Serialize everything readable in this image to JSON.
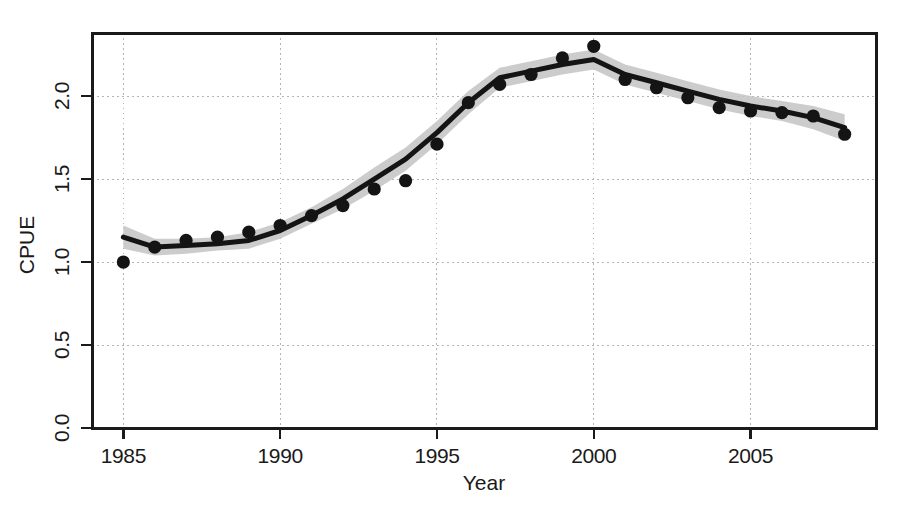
{
  "chart_data": {
    "type": "line",
    "title": "",
    "xlabel": "Year",
    "ylabel": "CPUE",
    "xlim": [
      1984.0,
      2009.0
    ],
    "ylim": [
      0.0,
      2.38
    ],
    "grid": true,
    "grid_style": "dotted-light-gray",
    "legend": "none",
    "x_ticks": [
      1985,
      1990,
      1995,
      2000,
      2005
    ],
    "x_tick_labels": [
      "1985",
      "1990",
      "1995",
      "2000",
      "2005"
    ],
    "y_ticks": [
      0.0,
      0.5,
      1.0,
      1.5,
      2.0
    ],
    "y_tick_labels": [
      "0.0",
      "0.5",
      "1.0",
      "1.5",
      "2.0"
    ],
    "x": [
      1985,
      1986,
      1987,
      1988,
      1989,
      1990,
      1991,
      1992,
      1993,
      1994,
      1995,
      1996,
      1997,
      1998,
      1999,
      2000,
      2001,
      2002,
      2003,
      2004,
      2005,
      2006,
      2007,
      2008
    ],
    "series": [
      {
        "name": "Observed CPUE",
        "style": "points",
        "marker": "filled-circle",
        "color": "#141414",
        "values": [
          1.0,
          1.09,
          1.13,
          1.15,
          1.18,
          1.22,
          1.28,
          1.34,
          1.44,
          1.49,
          1.71,
          1.96,
          2.07,
          2.13,
          2.23,
          2.3,
          2.1,
          2.05,
          1.99,
          1.93,
          1.91,
          1.9,
          1.88,
          1.77
        ]
      },
      {
        "name": "Fitted CPUE",
        "style": "line",
        "color": "#141414",
        "values": [
          1.15,
          1.09,
          1.1,
          1.11,
          1.13,
          1.19,
          1.28,
          1.38,
          1.5,
          1.62,
          1.78,
          1.96,
          2.11,
          2.15,
          2.19,
          2.22,
          2.13,
          2.08,
          2.03,
          1.98,
          1.94,
          1.91,
          1.87,
          1.81
        ]
      },
      {
        "name": "Confidence band (upper)",
        "style": "band-upper",
        "color": "#c8c8c8",
        "values": [
          1.22,
          1.14,
          1.14,
          1.15,
          1.18,
          1.24,
          1.33,
          1.44,
          1.57,
          1.69,
          1.85,
          2.03,
          2.17,
          2.21,
          2.25,
          2.28,
          2.19,
          2.14,
          2.09,
          2.04,
          2.0,
          1.97,
          1.94,
          1.89
        ]
      },
      {
        "name": "Confidence band (lower)",
        "style": "band-lower",
        "color": "#c8c8c8",
        "values": [
          1.08,
          1.04,
          1.05,
          1.07,
          1.08,
          1.14,
          1.23,
          1.32,
          1.43,
          1.55,
          1.71,
          1.89,
          2.05,
          2.09,
          2.13,
          2.16,
          2.07,
          2.02,
          1.97,
          1.92,
          1.88,
          1.85,
          1.8,
          1.73
        ]
      }
    ]
  },
  "axes": {
    "x_title": "Year",
    "y_title": "CPUE"
  },
  "colors": {
    "line": "#141414",
    "points": "#141414",
    "band": "#c8c8c8",
    "grid": "#b4b4b4",
    "frame": "#1a1a1a",
    "background": "#ffffff"
  }
}
